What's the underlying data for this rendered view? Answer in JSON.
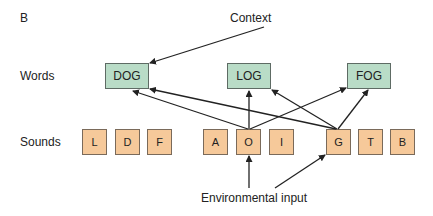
{
  "panel_label": "B",
  "rows": {
    "words_label": "Words",
    "sounds_label": "Sounds"
  },
  "words": [
    {
      "label": "DOG"
    },
    {
      "label": "LOG"
    },
    {
      "label": "FOG"
    }
  ],
  "sounds": [
    {
      "label": "L"
    },
    {
      "label": "D"
    },
    {
      "label": "F"
    },
    {
      "label": "A"
    },
    {
      "label": "O"
    },
    {
      "label": "I"
    },
    {
      "label": "G"
    },
    {
      "label": "T"
    },
    {
      "label": "B"
    }
  ],
  "annotations": {
    "context": "Context",
    "environmental_input": "Environmental input"
  },
  "connections": [
    {
      "from": "Context",
      "to": "DOG"
    },
    {
      "from": "O",
      "to": "DOG"
    },
    {
      "from": "O",
      "to": "LOG"
    },
    {
      "from": "O",
      "to": "FOG"
    },
    {
      "from": "G",
      "to": "DOG"
    },
    {
      "from": "G",
      "to": "LOG"
    },
    {
      "from": "G",
      "to": "FOG"
    },
    {
      "from": "Environmental input",
      "to": "O"
    },
    {
      "from": "Environmental input",
      "to": "G"
    }
  ],
  "colors": {
    "word_fill": "#b9dcc7",
    "sound_fill": "#f6c99a",
    "arrow": "#222222"
  }
}
